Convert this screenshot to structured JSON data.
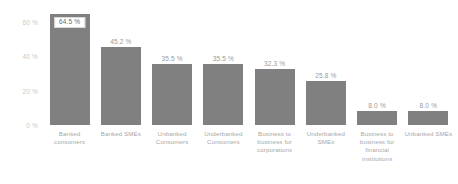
{
  "chart_data": {
    "type": "bar",
    "title": "",
    "subtitle": "",
    "xlabel": "",
    "ylabel": "",
    "categories": [
      "Banked consumers",
      "Banked SMEs",
      "Unbanked Consumers",
      "Underbanked Consumers",
      "Business to business for corporations",
      "Underbanked SMEs",
      "Business to business for financial institutions",
      "Unbanked SMEs"
    ],
    "values": [
      64.5,
      45.2,
      35.5,
      35.5,
      32.3,
      25.8,
      8.0,
      8.0
    ],
    "value_labels": [
      "64.5 %",
      "45.2 %",
      "35.5 %",
      "35.5 %",
      "32.3 %",
      "25.8 %",
      "8.0 %",
      "8.0 %"
    ],
    "highlighted_index": 0,
    "ylim": [
      0,
      68
    ],
    "yticks": [
      0,
      20,
      40,
      60
    ],
    "ytick_labels": [
      "0 %",
      "20 %",
      "40 %",
      "60 %"
    ],
    "grid": false,
    "legend": null,
    "bar_color": "#808080",
    "background_color": "#ffffff",
    "label_color": "#a8a8a8",
    "highlight_box_color": "#ffffff"
  }
}
